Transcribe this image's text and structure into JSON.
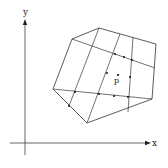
{
  "diagram": {
    "axes": {
      "x_label": "x",
      "y_label": "y",
      "x_axis": {
        "x1": 10,
        "y1": 143,
        "x2": 148,
        "y2": 143
      },
      "y_axis": {
        "x1": 25,
        "y1": 155,
        "x2": 25,
        "y2": 22
      },
      "color": "#555555"
    },
    "polygon": {
      "points": "99,28 156,44 152,99 87,123 53,89 72,39",
      "color": "#333333"
    },
    "grid_lines": [
      {
        "x1": 72,
        "y1": 39,
        "x2": 155,
        "y2": 68
      },
      {
        "x1": 53,
        "y1": 89,
        "x2": 152,
        "y2": 99
      },
      {
        "x1": 99,
        "y1": 28,
        "x2": 69,
        "y2": 106
      },
      {
        "x1": 120,
        "y1": 34,
        "x2": 87,
        "y2": 123
      },
      {
        "x1": 133,
        "y1": 37,
        "x2": 128,
        "y2": 112
      }
    ],
    "points": [
      {
        "x": 115,
        "y": 54
      },
      {
        "x": 124,
        "y": 57
      },
      {
        "x": 132,
        "y": 60
      },
      {
        "x": 107,
        "y": 73
      },
      {
        "x": 130,
        "y": 77
      },
      {
        "x": 99,
        "y": 94
      },
      {
        "x": 114,
        "y": 96
      },
      {
        "x": 128,
        "y": 97
      },
      {
        "x": 75,
        "y": 92
      },
      {
        "x": 69,
        "y": 106
      }
    ],
    "query_point": {
      "label": "p",
      "x": 118,
      "y": 75
    }
  }
}
